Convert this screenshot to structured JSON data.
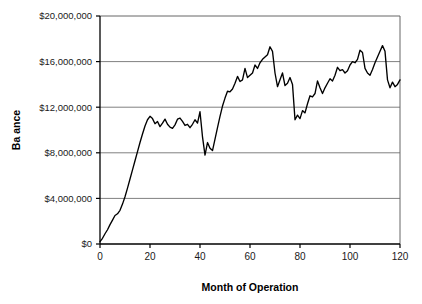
{
  "chart_data": {
    "type": "line",
    "title": "",
    "xlabel": "Month of Operation",
    "ylabel": "Ba ance",
    "xlim": [
      0,
      120
    ],
    "ylim": [
      0,
      20000000
    ],
    "grid": "horizontal",
    "legend": "none",
    "line_color": "#000000",
    "gridline_color": "#808080",
    "axis_color": "#000000",
    "background_color": "#ffffff",
    "xticks": [
      0,
      20,
      40,
      60,
      80,
      100,
      120
    ],
    "xtick_labels": [
      "0",
      "20",
      "40",
      "60",
      "80",
      "100",
      "120"
    ],
    "yticks": [
      0,
      4000000,
      8000000,
      12000000,
      16000000,
      20000000
    ],
    "ytick_labels": [
      "$0",
      "$4,000,000",
      "$8,000,000",
      "$12,000,000",
      "$16,000,000",
      "$20,000,000"
    ],
    "series": [
      {
        "name": "Balance",
        "x": [
          0,
          1,
          2,
          3,
          4,
          5,
          6,
          7,
          8,
          9,
          10,
          11,
          12,
          13,
          14,
          15,
          16,
          17,
          18,
          19,
          20,
          21,
          22,
          23,
          24,
          25,
          26,
          27,
          28,
          29,
          30,
          31,
          32,
          33,
          34,
          35,
          36,
          37,
          38,
          39,
          40,
          41,
          42,
          43,
          44,
          45,
          46,
          47,
          48,
          49,
          50,
          51,
          52,
          53,
          54,
          55,
          56,
          57,
          58,
          59,
          60,
          61,
          62,
          63,
          64,
          65,
          66,
          67,
          68,
          69,
          70,
          71,
          72,
          73,
          74,
          75,
          76,
          77,
          78,
          79,
          80,
          81,
          82,
          83,
          84,
          85,
          86,
          87,
          88,
          89,
          90,
          91,
          92,
          93,
          94,
          95,
          96,
          97,
          98,
          99,
          100,
          101,
          102,
          103,
          104,
          105,
          106,
          107,
          108,
          109,
          110,
          111,
          112,
          113,
          114,
          115,
          116,
          117,
          118,
          119,
          120
        ],
        "values": [
          200000,
          500000,
          900000,
          1250000,
          1700000,
          2100000,
          2500000,
          2650000,
          2950000,
          3500000,
          4150000,
          4900000,
          5700000,
          6500000,
          7300000,
          8100000,
          8900000,
          9650000,
          10350000,
          10900000,
          11200000,
          11000000,
          10550000,
          10750000,
          10300000,
          10600000,
          10950000,
          10500000,
          10250000,
          10150000,
          10450000,
          10950000,
          11050000,
          10750000,
          10400000,
          10500000,
          10200000,
          10500000,
          10900000,
          10600000,
          11600000,
          9400000,
          7800000,
          8900000,
          8400000,
          8200000,
          9200000,
          10200000,
          11200000,
          12100000,
          12800000,
          13400000,
          13350000,
          13600000,
          14100000,
          14700000,
          14250000,
          14400000,
          15400000,
          14600000,
          14800000,
          15000000,
          15700000,
          15400000,
          15900000,
          16200000,
          16400000,
          16600000,
          17300000,
          16900000,
          15000000,
          13800000,
          14400000,
          15000000,
          13900000,
          14100000,
          14600000,
          14000000,
          10900000,
          11300000,
          11000000,
          11700000,
          11500000,
          12300000,
          13000000,
          12900000,
          13200000,
          14300000,
          13700000,
          13200000,
          13700000,
          14100000,
          14500000,
          14300000,
          14800000,
          15500000,
          15200000,
          15300000,
          15000000,
          15200000,
          15700000,
          16000000,
          15900000,
          16200000,
          17000000,
          16800000,
          15400000,
          15000000,
          14800000,
          15300000,
          15900000,
          16400000,
          16900000,
          17400000,
          16900000,
          14400000,
          13700000,
          14200000,
          13800000,
          14000000,
          14400000
        ]
      }
    ]
  },
  "axes": {
    "ylabel_text": "Ba ance",
    "xlabel_text": "Month of Operation"
  }
}
